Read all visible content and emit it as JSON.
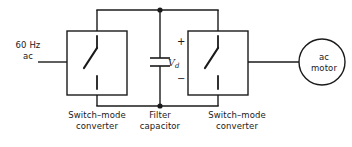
{
  "diagram": {
    "stroke_color": "#1a1a1a",
    "background_color": "#ffffff"
  },
  "labels": {
    "source": "60 Hz\nac",
    "left_converter": "Switch–mode\nconverter",
    "filter_capacitor": "Filter\ncapacitor",
    "right_converter": "Switch–mode\nconverter",
    "motor": "ac\nmotor",
    "dc_voltage": "V",
    "dc_voltage_subscript": "d",
    "polarity_positive": "+",
    "polarity_negative": "−"
  },
  "components": {
    "left_converter_symbol": "switch-icon",
    "right_converter_symbol": "switch-icon",
    "capacitor_symbol": "capacitor-icon",
    "motor_symbol": "circle-node"
  }
}
